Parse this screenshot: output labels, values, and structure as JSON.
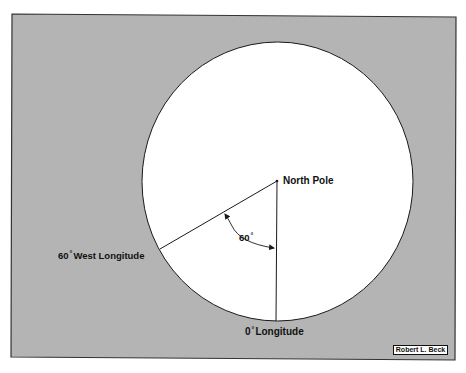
{
  "diagram": {
    "type": "polar-view longitude diagram",
    "colors": {
      "page_background": "#ffffff",
      "frame_fill": "#b4b4b4",
      "frame_border": "#333333",
      "globe_fill": "#ffffff",
      "line_color": "#1a1a1a",
      "text_color": "#111111"
    },
    "labels": {
      "north_pole": "North Pole",
      "west_longitude": {
        "degrees": "60",
        "degree_symbol": "°",
        "text": "West Longitude"
      },
      "prime_meridian": {
        "degrees": "0",
        "degree_symbol": "°",
        "text": "Longitude"
      },
      "angle": {
        "degrees": "60",
        "degree_symbol": "°"
      }
    },
    "credit": "Robert L. Beck",
    "geometry": {
      "angle_between_meridians_deg": 60,
      "pole_center": [
        277,
        181
      ]
    }
  }
}
